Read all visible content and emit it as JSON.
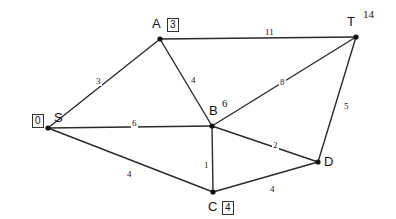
{
  "diagram": {
    "background_color": "#ffffff",
    "edge_color": "#2b2b2b",
    "node_color": "#111111",
    "nodes": [
      {
        "id": "S",
        "label": "S",
        "distance": "0",
        "distance_style": "boxed",
        "x": 48,
        "y": 128,
        "label_dx": 6,
        "label_dy": -17,
        "dist_dx": -16,
        "dist_dy": -14
      },
      {
        "id": "A",
        "label": "A",
        "distance": "3",
        "distance_style": "boxed",
        "x": 160,
        "y": 39,
        "label_dx": -8,
        "label_dy": -22,
        "dist_dx": 7,
        "dist_dy": -21
      },
      {
        "id": "B",
        "label": "B",
        "distance": "6",
        "distance_style": "plain",
        "x": 212,
        "y": 126,
        "label_dx": -3,
        "label_dy": -22,
        "dist_dx": 10,
        "dist_dy": -28
      },
      {
        "id": "C",
        "label": "C",
        "distance": "4",
        "distance_style": "boxed",
        "x": 213,
        "y": 192,
        "label_dx": -5,
        "label_dy": 8,
        "dist_dx": 9,
        "dist_dy": 9
      },
      {
        "id": "D",
        "label": "D",
        "distance": "",
        "distance_style": "none",
        "x": 318,
        "y": 162,
        "label_dx": 6,
        "label_dy": -7,
        "dist_dx": 0,
        "dist_dy": 0
      },
      {
        "id": "T",
        "label": "T",
        "distance": "14",
        "distance_style": "plain",
        "x": 356,
        "y": 37,
        "label_dx": -9,
        "label_dy": -22,
        "dist_dx": 7,
        "dist_dy": -28
      }
    ],
    "edges": [
      {
        "from": "S",
        "to": "A",
        "weight": "3",
        "lx": 95,
        "ly": 77
      },
      {
        "from": "S",
        "to": "B",
        "weight": "6",
        "lx": 131,
        "ly": 119
      },
      {
        "from": "S",
        "to": "C",
        "weight": "4",
        "lx": 126,
        "ly": 170
      },
      {
        "from": "A",
        "to": "T",
        "weight": "11",
        "lx": 264,
        "ly": 28
      },
      {
        "from": "A",
        "to": "B",
        "weight": "4",
        "lx": 190,
        "ly": 76
      },
      {
        "from": "B",
        "to": "T",
        "weight": "8",
        "lx": 279,
        "ly": 78
      },
      {
        "from": "B",
        "to": "C",
        "weight": "1",
        "lx": 203,
        "ly": 161
      },
      {
        "from": "B",
        "to": "D",
        "weight": "2",
        "lx": 272,
        "ly": 141
      },
      {
        "from": "C",
        "to": "D",
        "weight": "4",
        "lx": 269,
        "ly": 185
      },
      {
        "from": "T",
        "to": "D",
        "weight": "5",
        "lx": 343,
        "ly": 102
      }
    ]
  }
}
